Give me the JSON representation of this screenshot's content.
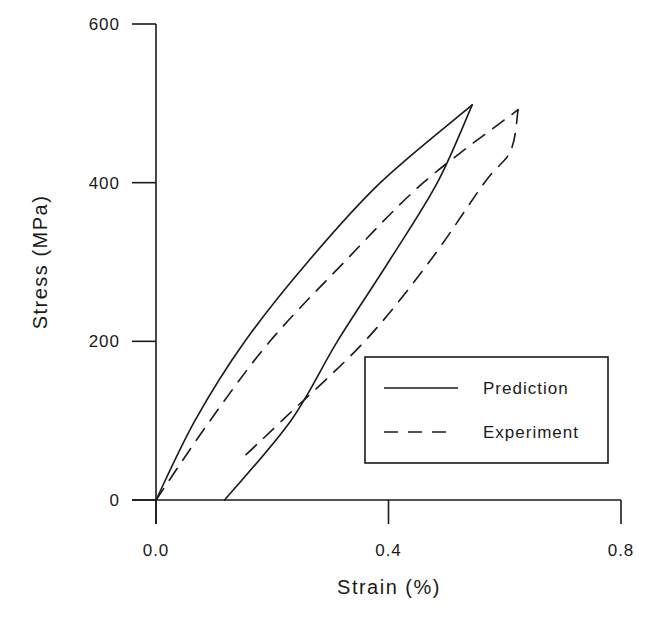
{
  "chart_data": {
    "type": "line",
    "title": "",
    "xlabel": "Strain (%)",
    "ylabel": "Stress (MPa)",
    "xlim": [
      0.0,
      0.8
    ],
    "ylim": [
      0,
      600
    ],
    "xticks": [
      "0.0",
      "0.4",
      "0.8"
    ],
    "yticks": [
      "0",
      "200",
      "400",
      "600"
    ],
    "grid": false,
    "legend_position": "lower right",
    "series": [
      {
        "name": "Prediction",
        "style": "solid",
        "color": "#1a1a1a",
        "loading": {
          "x": [
            0.0,
            0.067,
            0.153,
            0.261,
            0.386,
            0.544
          ],
          "y": [
            0,
            100,
            200,
            300,
            400,
            498
          ]
        },
        "unloading": {
          "x": [
            0.544,
            0.484,
            0.4,
            0.312,
            0.232,
            0.118
          ],
          "y": [
            498,
            400,
            300,
            200,
            100,
            0
          ]
        }
      },
      {
        "name": "Experiment",
        "style": "dashed",
        "color": "#1a1a1a",
        "loading": {
          "x": [
            0.0,
            0.093,
            0.196,
            0.324,
            0.46,
            0.623
          ],
          "y": [
            0,
            100,
            200,
            300,
            400,
            492
          ]
        },
        "unloading": {
          "x": [
            0.623,
            0.61,
            0.565,
            0.47,
            0.359,
            0.218,
            0.149
          ],
          "y": [
            492,
            440,
            400,
            300,
            200,
            101,
            53
          ]
        }
      }
    ]
  },
  "legend": {
    "items": [
      {
        "label": "Prediction",
        "style": "solid"
      },
      {
        "label": "Experiment",
        "style": "dashed"
      }
    ]
  }
}
